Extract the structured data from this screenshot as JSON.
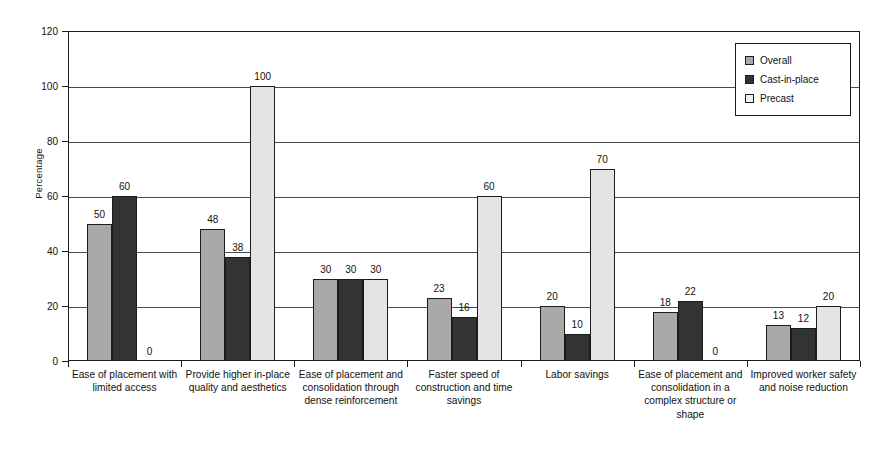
{
  "chart_data": {
    "type": "bar",
    "title": "",
    "xlabel": "",
    "ylabel": "Percentage",
    "ylim": [
      0,
      120
    ],
    "ytick_values": [
      0,
      20,
      40,
      60,
      80,
      100,
      120
    ],
    "ytick_labels": [
      "0",
      "20",
      "40",
      "60",
      "80",
      "100",
      "120"
    ],
    "grid": true,
    "legend_position": "top-right",
    "categories": [
      "Ease of placement with limited access",
      "Provide higher in-place quality and aesthetics",
      "Ease of placement and consolidation through dense reinforcement",
      "Faster speed of construction and time savings",
      "Labor savings",
      "Ease of placement and consolidation in a complex structure or shape",
      "Improved worker safety and noise reduction"
    ],
    "series": [
      {
        "name": "Overall",
        "color": "#a9a9a9",
        "values": [
          50,
          48,
          30,
          23,
          20,
          18,
          13
        ]
      },
      {
        "name": "Cast-in-place",
        "color": "#333333",
        "values": [
          60,
          38,
          30,
          16,
          10,
          22,
          12
        ]
      },
      {
        "name": "Precast",
        "color": "#e4e4e4",
        "values": [
          0,
          100,
          30,
          60,
          70,
          0,
          20
        ]
      }
    ]
  }
}
